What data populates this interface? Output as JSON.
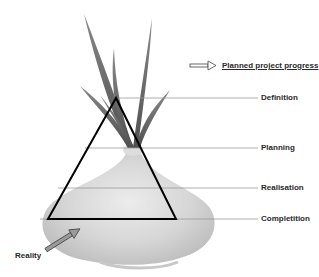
{
  "diagram": {
    "legend": {
      "label": "Planned project progress",
      "icon": "arrow-right-icon"
    },
    "stages": [
      {
        "label": "Definition",
        "y": 98
      },
      {
        "label": "Planning",
        "y": 148
      },
      {
        "label": "Realisation",
        "y": 188
      },
      {
        "label": "Completition",
        "y": 219
      }
    ],
    "reality": {
      "label": "Reality",
      "icon": "arrow-up-right-icon"
    },
    "colors": {
      "triangle_stroke": "#000000",
      "stage_line": "#9a9a9a",
      "onion_body": "#d4d4d4",
      "onion_leaves": "#6e6e6e",
      "text": "#2a2a2a"
    }
  }
}
